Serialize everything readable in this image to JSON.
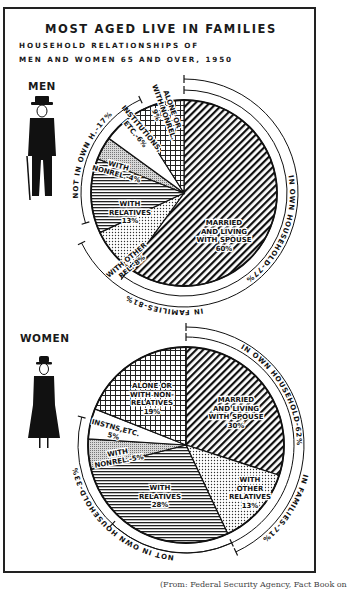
{
  "title": "MOST AGED LIVE IN FAMILIES",
  "subtitle_line1": "HOUSEHOLD RELATIONSHIPS OF",
  "subtitle_line2": "MEN AND WOMEN 65 AND OVER, 1950",
  "footer": "(From: Federal Security Agency, Fact Book on",
  "colors": {
    "ink": "#1a1a1a",
    "paper": "#ffffff"
  },
  "icons": {
    "men": "man-with-cane-icon",
    "women": "woman-with-hat-icon"
  },
  "chart_data": [
    {
      "type": "pie",
      "title": "MEN",
      "categories": [
        "Married and living with spouse",
        "With other rel.",
        "With relatives",
        "With nonrel.",
        "Institutions, etc.",
        "Alone or with nonrel."
      ],
      "values": [
        60,
        8,
        13,
        4,
        6,
        9
      ],
      "labels": [
        "MARRIED|AND LIVING|WITH SPOUSE|60%",
        "WITH OTHER|REL.-8%",
        "WITH|RELATIVES|13%",
        "WITH|NONREL.-4%",
        "INSTITUTIONS,|ETC.-6%",
        "ALONE OR|WITH NONREL.|9%"
      ],
      "groups": [
        {
          "label": "IN OWN HOUSEHOLD-77%",
          "value": 77
        },
        {
          "label": "NOT IN OWN H.-17%",
          "value": 17
        },
        {
          "label": "IN FAMILIES-81%",
          "value": 81
        }
      ]
    },
    {
      "type": "pie",
      "title": "WOMEN",
      "categories": [
        "Married and living with spouse",
        "With other relatives",
        "With relatives",
        "With nonrel.",
        "Instns, etc.",
        "Alone or with non-relatives"
      ],
      "values": [
        30,
        13,
        28,
        5,
        5,
        19
      ],
      "labels": [
        "MARRIED|AND LIVING|WITH SPOUSE|30%",
        "WITH|OTHER|RELATIVES|13%",
        "WITH|RELATIVES|28%",
        "WITH|NONREL.-5%",
        "INSTNS,ETC.|5%",
        "ALONE OR|WITH NON-|RELATIVES|19%"
      ],
      "groups": [
        {
          "label": "IN OWN HOUSEHOLD-62%",
          "value": 62
        },
        {
          "label": "NOT IN OWN HOUSEHOLD-33%",
          "value": 33
        },
        {
          "label": "IN FAMILIES-71%",
          "value": 71
        }
      ]
    }
  ]
}
